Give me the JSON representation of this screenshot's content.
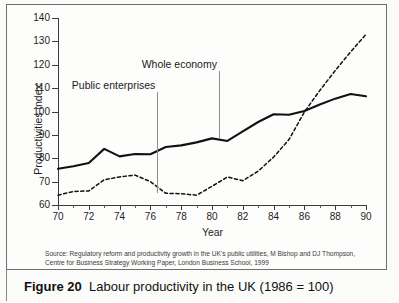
{
  "figure": {
    "number_label": "Figure 20",
    "caption": "Labour productivity in the UK (1986 = 100)",
    "source": "Source: Regulatory reform and productivity growth in the UK's public utilities, M Bishop and DJ Thompson, Centre for Business Strategy Working Paper, London Business School, 1999"
  },
  "chart_data": {
    "type": "line",
    "title": "Labour productivity in the UK (1986 = 100)",
    "xlabel": "Year",
    "ylabel": "Productivities index",
    "xlim": [
      70,
      90
    ],
    "ylim": [
      60,
      140
    ],
    "ytick_labels": [
      "60",
      "70",
      "80",
      "90",
      "100",
      "110",
      "120",
      "130",
      "140"
    ],
    "yticks": [
      60,
      70,
      80,
      90,
      100,
      110,
      120,
      130,
      140
    ],
    "xtick_labels": [
      "70",
      "72",
      "74",
      "76",
      "78",
      "80",
      "82",
      "84",
      "86",
      "88",
      "90"
    ],
    "xticks": [
      70,
      72,
      74,
      76,
      78,
      80,
      82,
      84,
      86,
      88,
      90
    ],
    "x": [
      70,
      71,
      72,
      73,
      74,
      75,
      76,
      77,
      78,
      79,
      80,
      81,
      82,
      83,
      84,
      85,
      86,
      87,
      88,
      89,
      90
    ],
    "grid": false,
    "legend_position": "inline-annotations",
    "series": [
      {
        "name": "Whole economy",
        "style": "solid",
        "color": "#111111",
        "values": [
          75.5,
          76.6,
          78.0,
          84.0,
          80.8,
          81.8,
          81.7,
          84.8,
          85.5,
          86.8,
          88.5,
          87.4,
          91.5,
          95.5,
          98.8,
          98.6,
          100.2,
          103.0,
          105.5,
          107.5,
          106.5
        ]
      },
      {
        "name": "Public enterprises",
        "style": "dashed",
        "color": "#111111",
        "values": [
          64.2,
          65.8,
          66.0,
          70.8,
          72.0,
          72.8,
          70.0,
          65.0,
          64.8,
          64.2,
          68.0,
          72.0,
          70.4,
          74.5,
          80.5,
          88.0,
          99.8,
          109.0,
          117.5,
          125.5,
          133.0
        ]
      }
    ],
    "annotations": [
      {
        "text": "Public enterprises",
        "pointer_year": 76.45,
        "pointer_top_value": 108.5,
        "pointer_bottom_value": 65.0
      },
      {
        "text": "Whole economy",
        "pointer_year": 80.45,
        "pointer_top_value": 117.5,
        "pointer_bottom_value": 88.5
      }
    ]
  }
}
